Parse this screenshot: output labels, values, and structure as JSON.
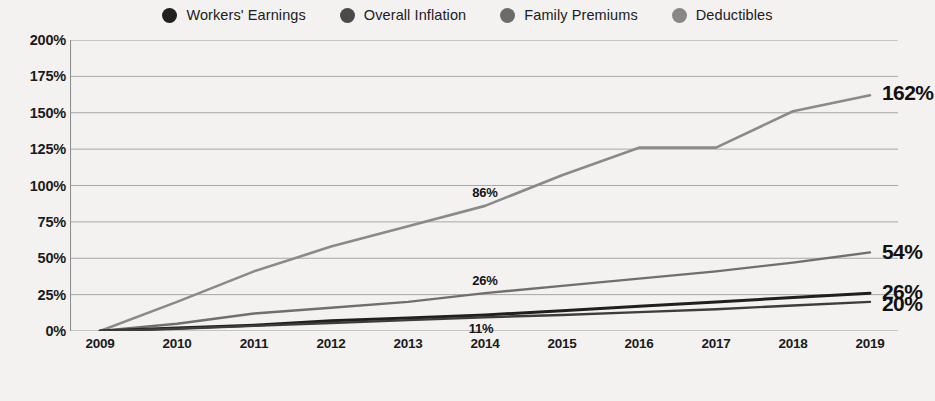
{
  "legend": {
    "items": [
      {
        "label": "Workers' Earnings",
        "color": "#231f20",
        "icon": "legend-dot-icon"
      },
      {
        "label": "Overall Inflation",
        "color": "#4a4a4a",
        "icon": "legend-dot-icon"
      },
      {
        "label": "Family Premiums",
        "color": "#6b6b6b",
        "icon": "legend-dot-icon"
      },
      {
        "label": "Deductibles",
        "color": "#878787",
        "icon": "legend-dot-icon"
      }
    ]
  },
  "axes": {
    "y_ticks": [
      "200%",
      "175%",
      "150%",
      "125%",
      "100%",
      "75%",
      "50%",
      "25%",
      "0%"
    ],
    "x_ticks": [
      "2009",
      "2010",
      "2011",
      "2012",
      "2013",
      "2014",
      "2015",
      "2016",
      "2017",
      "2018",
      "2019"
    ]
  },
  "annotations": [
    {
      "text": "86%",
      "series": "Deductibles",
      "x": "2014",
      "value": 86
    },
    {
      "text": "26%",
      "series": "Family Premiums",
      "x": "2014",
      "value": 26
    },
    {
      "text": "11%",
      "series": "Workers' Earnings",
      "x": "2014",
      "value": 11
    }
  ],
  "end_labels": [
    {
      "text": "162%",
      "series": "Deductibles",
      "value": 162
    },
    {
      "text": "54%",
      "series": "Family Premiums",
      "value": 54
    },
    {
      "text": "26%",
      "series": "Workers' Earnings",
      "value": 26
    },
    {
      "text": "20%",
      "series": "Overall Inflation",
      "value": 20
    }
  ],
  "chart_data": {
    "type": "line",
    "title": "",
    "subtitle": "",
    "xlabel": "",
    "ylabel": "",
    "x": [
      2009,
      2010,
      2011,
      2012,
      2013,
      2014,
      2015,
      2016,
      2017,
      2018,
      2019
    ],
    "categories": [
      "2009",
      "2010",
      "2011",
      "2012",
      "2013",
      "2014",
      "2015",
      "2016",
      "2017",
      "2018",
      "2019"
    ],
    "ylim": [
      0,
      200
    ],
    "ytick_values": [
      0,
      25,
      50,
      75,
      100,
      125,
      150,
      175,
      200
    ],
    "ytick_format": "percent",
    "grid": true,
    "legend_position": "top-center",
    "series": [
      {
        "name": "Deductibles",
        "color": "#8a8a8a",
        "width": 2.6,
        "values": [
          0,
          20,
          41,
          58,
          72,
          86,
          107,
          126,
          126,
          151,
          162
        ]
      },
      {
        "name": "Family Premiums",
        "color": "#6f6f6f",
        "width": 2.4,
        "values": [
          0,
          5,
          12,
          16,
          20,
          26,
          31,
          36,
          41,
          47,
          54
        ]
      },
      {
        "name": "Workers' Earnings",
        "color": "#1f1f1f",
        "width": 3.0,
        "values": [
          0,
          2,
          4,
          7,
          9,
          11,
          14,
          17,
          20,
          23,
          26
        ]
      },
      {
        "name": "Overall Inflation",
        "color": "#3d3d3d",
        "width": 2.4,
        "values": [
          0,
          1.5,
          3.5,
          5.5,
          7.5,
          9.5,
          11,
          13,
          15,
          17.5,
          20
        ]
      }
    ]
  }
}
